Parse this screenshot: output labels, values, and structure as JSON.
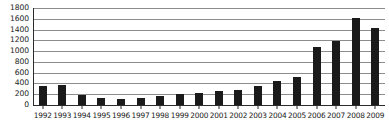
{
  "chart_data": {
    "type": "bar",
    "title": "",
    "subtitle": "",
    "xlabel": "",
    "ylabel": "",
    "categories": [
      "1992",
      "1993",
      "1994",
      "1995",
      "1996",
      "1997",
      "1998",
      "1999",
      "2000",
      "2001",
      "2002",
      "2003",
      "2004",
      "2005",
      "2006",
      "2007",
      "2008",
      "2009"
    ],
    "values": [
      350,
      370,
      190,
      130,
      115,
      135,
      160,
      205,
      220,
      255,
      275,
      350,
      445,
      520,
      1080,
      1180,
      1620,
      1420
    ],
    "series": [
      {
        "name": "",
        "values": [
          350,
          370,
          190,
          130,
          115,
          135,
          160,
          205,
          220,
          255,
          275,
          350,
          445,
          520,
          1080,
          1180,
          1620,
          1420
        ]
      }
    ],
    "ylim": [
      0,
      1800
    ],
    "yticks": [
      0,
      200,
      400,
      600,
      800,
      1000,
      1200,
      1400,
      1600,
      1800
    ],
    "ytick_labels": [
      "0",
      "200",
      "400",
      "600",
      "800",
      "1000",
      "1200",
      "1400",
      "1600",
      "1800"
    ],
    "grid": true,
    "grid_axis": "y",
    "legend": false,
    "legend_position": "none",
    "annotations": []
  },
  "style": {
    "bar_color": "#1a1a1a",
    "gridline_color": "#8d8d8d",
    "axis_color": "#2b2b2b",
    "background_color": "#ffffff",
    "text_color": "#1b1b1b"
  }
}
